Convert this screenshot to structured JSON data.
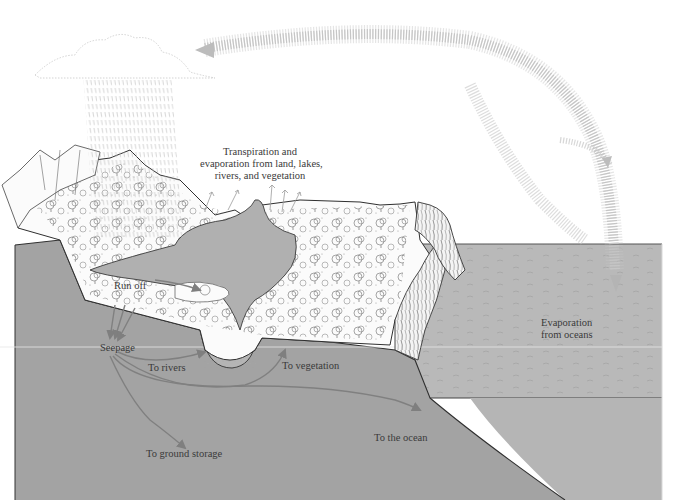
{
  "colors": {
    "background": "#ffffff",
    "ground": "#a3a3a3",
    "ocean": "#b9b9b9",
    "ocean_deep": "#a8a8a8",
    "lake": "#b0b0b0",
    "land_surface": "#fbfbfb",
    "arrow_ground": "#808080",
    "arrow_vapor": "#c4c4c4",
    "outline": "#333333",
    "label_text": "#3a3a3a"
  },
  "labels": {
    "transpiration": {
      "line1": "Transpiration and",
      "line2": "evaporation from land, lakes,",
      "line3": "rivers, and vegetation"
    },
    "run_off": "Run off",
    "seepage": "Seepage",
    "to_rivers": "To rivers",
    "to_vegetation": "To vegetation",
    "to_ground_storage": "To ground storage",
    "to_the_ocean": "To the ocean",
    "evaporation_oceans": {
      "line1": "Evaporation",
      "line2": "from oceans"
    }
  },
  "elements": {
    "cloud": "rain-cloud",
    "precipitation": "rain-streaks",
    "vapor_arrow": "curved-vapor-arrow",
    "landmass": "land-with-forest-and-cliffs",
    "lake": "inland-lake",
    "ocean": "ocean-body",
    "flow_arrows": [
      "seepage-to-rivers",
      "seepage-to-vegetation",
      "seepage-to-ground-storage",
      "seepage-to-ocean",
      "run-off-arrow"
    ]
  }
}
